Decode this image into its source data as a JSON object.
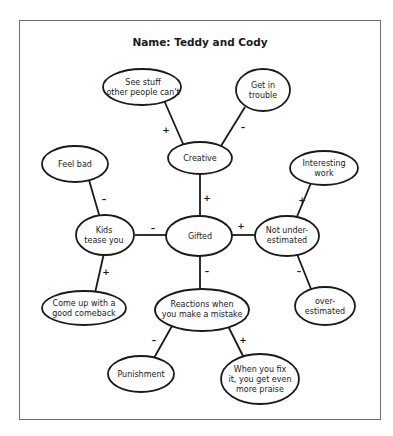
{
  "title": "Name: Teddy and Cody",
  "colors": {
    "ink": "#1a1a1a",
    "frame_border": "#6e6e6e",
    "background": "#ffffff"
  },
  "nodes": {
    "see_stuff": {
      "lines": [
        "See stuff",
        "other people can't"
      ]
    },
    "get_in_trouble": {
      "lines": [
        "Get in",
        "trouble"
      ]
    },
    "creative": {
      "lines": [
        "Creative"
      ]
    },
    "feel_bad": {
      "lines": [
        "Feel bad"
      ]
    },
    "interesting_work": {
      "lines": [
        "Interesting",
        "work"
      ]
    },
    "kids_tease": {
      "lines": [
        "Kids",
        "tease you"
      ]
    },
    "gifted": {
      "lines": [
        "Gifted"
      ]
    },
    "not_under": {
      "lines": [
        "Not under-",
        "estimated"
      ]
    },
    "come_up": {
      "lines": [
        "Come up with a",
        "good comeback"
      ]
    },
    "reactions": {
      "lines": [
        "Reactions when",
        "you make a mistake"
      ]
    },
    "over_est": {
      "lines": [
        "over-",
        "estimated"
      ]
    },
    "punishment": {
      "lines": [
        "Punishment"
      ]
    },
    "when_fix": {
      "lines": [
        "When you fix",
        "it, you get even",
        "more praise"
      ]
    }
  },
  "edges": [
    {
      "from": "creative",
      "to": "see_stuff",
      "sign": "+"
    },
    {
      "from": "creative",
      "to": "get_in_trouble",
      "sign": "–"
    },
    {
      "from": "gifted",
      "to": "creative",
      "sign": "+"
    },
    {
      "from": "kids_tease",
      "to": "feel_bad",
      "sign": "–"
    },
    {
      "from": "gifted",
      "to": "kids_tease",
      "sign": "–"
    },
    {
      "from": "gifted",
      "to": "not_under",
      "sign": "+"
    },
    {
      "from": "not_under",
      "to": "interesting_work",
      "sign": "+"
    },
    {
      "from": "kids_tease",
      "to": "come_up",
      "sign": "+"
    },
    {
      "from": "gifted",
      "to": "reactions",
      "sign": "–"
    },
    {
      "from": "not_under",
      "to": "over_est",
      "sign": "–"
    },
    {
      "from": "reactions",
      "to": "punishment",
      "sign": "–"
    },
    {
      "from": "reactions",
      "to": "when_fix",
      "sign": "+"
    }
  ]
}
